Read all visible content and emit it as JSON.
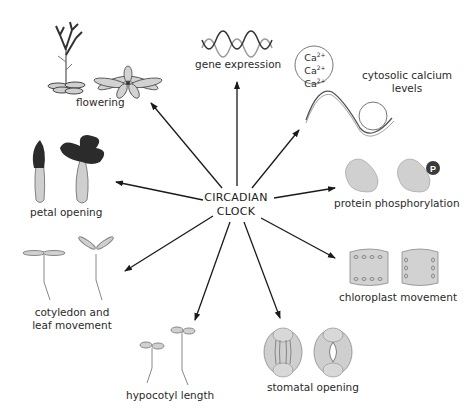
{
  "diagram": {
    "center": {
      "line1": "CIRCADIAN",
      "line2": "CLOCK"
    },
    "outputs": {
      "flowering": "flowering",
      "gene_expression": "gene expression",
      "calcium": {
        "line1": "cytosolic calcium",
        "line2": "levels",
        "ion": "Ca",
        "charge": "2+"
      },
      "petal_opening": "petal opening",
      "protein_phosphorylation": "protein phosphorylation",
      "phospho_badge": "P",
      "cotyledon": {
        "line1": "cotyledon and",
        "line2": "leaf movement"
      },
      "chloroplast_movement": "chloroplast movement",
      "hypocotyl_length": "hypocotyl  length",
      "stomatal_opening": "stomatal opening"
    },
    "colors": {
      "arrow": "#1a1a1a",
      "fill_light": "#cfcfcf",
      "fill_dark": "#2b2b2b",
      "stroke": "#555555"
    }
  }
}
